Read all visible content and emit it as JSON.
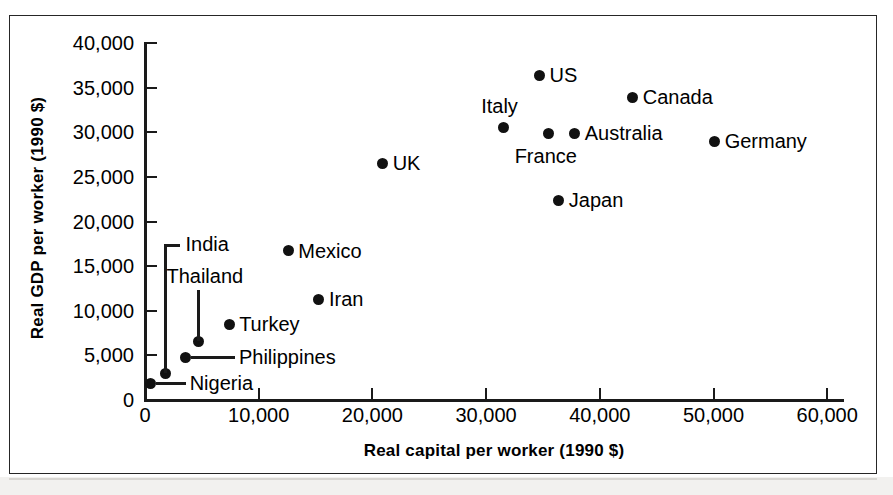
{
  "figure": {
    "kind": "scatter-plot",
    "frame_color": "#262626"
  },
  "chart_data": {
    "type": "scatter",
    "title": "",
    "xlabel": "Real capital per worker (1990 $)",
    "ylabel": "Real GDP per worker (1990 $)",
    "xlim": [
      0,
      62000
    ],
    "ylim": [
      0,
      40000
    ],
    "grid": false,
    "legend": "none",
    "point_color": "#111111",
    "x_ticks": [
      0,
      10000,
      20000,
      30000,
      40000,
      50000,
      60000
    ],
    "x_tick_labels": [
      "0",
      "10,000",
      "20,000",
      "30,000",
      "40,000",
      "50,000",
      "60,000"
    ],
    "y_ticks": [
      0,
      5000,
      10000,
      15000,
      20000,
      25000,
      30000,
      35000,
      40000
    ],
    "y_tick_labels": [
      "0",
      "5,000",
      "10,000",
      "15,000",
      "20,000",
      "25,000",
      "30,000",
      "35,000",
      "40,000"
    ],
    "points": [
      {
        "label": "Nigeria",
        "x": 500,
        "y": 1900,
        "label_pos": "right-leader"
      },
      {
        "label": "India",
        "x": 1800,
        "y": 3000,
        "label_pos": "up-leader"
      },
      {
        "label": "Philippines",
        "x": 3600,
        "y": 4800,
        "label_pos": "right-leader"
      },
      {
        "label": "Thailand",
        "x": 4700,
        "y": 6600,
        "label_pos": "up-leader"
      },
      {
        "label": "Turkey",
        "x": 7400,
        "y": 8500,
        "label_pos": "right"
      },
      {
        "label": "Mexico",
        "x": 12600,
        "y": 16700,
        "label_pos": "right"
      },
      {
        "label": "Iran",
        "x": 15300,
        "y": 11300,
        "label_pos": "right"
      },
      {
        "label": "UK",
        "x": 20900,
        "y": 26500,
        "label_pos": "right"
      },
      {
        "label": "Italy",
        "x": 31500,
        "y": 30500,
        "label_pos": "above"
      },
      {
        "label": "US",
        "x": 34700,
        "y": 36400,
        "label_pos": "right"
      },
      {
        "label": "France",
        "x": 35500,
        "y": 29900,
        "label_pos": "below"
      },
      {
        "label": "Japan",
        "x": 36400,
        "y": 22400,
        "label_pos": "right"
      },
      {
        "label": "Australia",
        "x": 37800,
        "y": 29900,
        "label_pos": "right"
      },
      {
        "label": "Canada",
        "x": 42900,
        "y": 33900,
        "label_pos": "right"
      },
      {
        "label": "Germany",
        "x": 50100,
        "y": 29000,
        "label_pos": "right"
      }
    ]
  }
}
